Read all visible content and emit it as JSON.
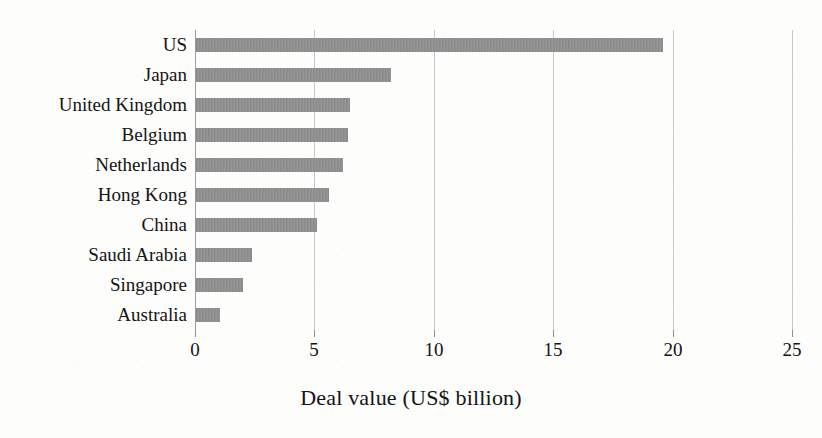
{
  "chart_data": {
    "type": "bar",
    "orientation": "horizontal",
    "title": "",
    "title_remnant": "(cropped heading above chart)",
    "categories": [
      "US",
      "Japan",
      "United Kingdom",
      "Belgium",
      "Netherlands",
      "Hong Kong",
      "China",
      "Saudi Arabia",
      "Singapore",
      "Australia"
    ],
    "values": [
      19.6,
      8.2,
      6.5,
      6.4,
      6.2,
      5.6,
      5.1,
      2.4,
      2.0,
      1.05
    ],
    "series": [
      {
        "name": "Deal value",
        "values": [
          19.6,
          8.2,
          6.5,
          6.4,
          6.2,
          5.6,
          5.1,
          2.4,
          2.0,
          1.05
        ]
      }
    ],
    "xlabel": "Deal value (US$ billion)",
    "ylabel": "",
    "xlim": [
      0,
      25
    ],
    "xticks": [
      0,
      5,
      10,
      15,
      20,
      25
    ],
    "xticklabels": [
      "0",
      "5",
      "10",
      "15",
      "20",
      "25"
    ],
    "grid": true,
    "grid_axis": "x",
    "legend": false,
    "legend_position": "none",
    "bar_color": "#8c8c8c",
    "gridline_color": "#c9c9c9",
    "background_color": "#fdfdfc",
    "text_color": "#141414"
  },
  "axis": {
    "x_title": "Deal value (US$ billion)"
  }
}
